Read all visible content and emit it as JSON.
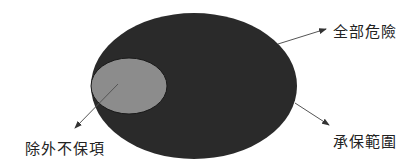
{
  "diagram": {
    "labels": {
      "all_risks": "全部危險",
      "covered_scope": "承保範圍",
      "exclusions": "除外不保項"
    },
    "colors": {
      "outer_ellipse": "#2a2a2a",
      "inner_ellipse": "#8c8c8c",
      "arrow": "#555555",
      "text": "#222222",
      "background": "#ffffff"
    }
  }
}
